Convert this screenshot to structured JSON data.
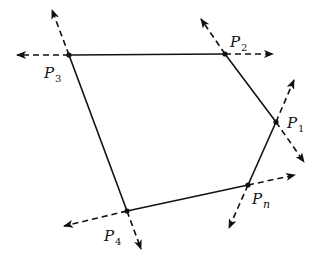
{
  "diagram": {
    "type": "polygon-with-edge-direction-arrows",
    "stroke_color": "#111111",
    "background": "#ffffff",
    "vertices": [
      {
        "id": "P1",
        "label": "P",
        "subscript": "1",
        "x": 276,
        "y": 122,
        "label_x": 287,
        "label_y": 128
      },
      {
        "id": "P2",
        "label": "P",
        "subscript": "2",
        "x": 225,
        "y": 54,
        "label_x": 230,
        "label_y": 47
      },
      {
        "id": "P3",
        "label": "P",
        "subscript": "3",
        "x": 69,
        "y": 55,
        "label_x": 44,
        "label_y": 78
      },
      {
        "id": "P4",
        "label": "P",
        "subscript": "4",
        "x": 127,
        "y": 211,
        "label_x": 104,
        "label_y": 241
      },
      {
        "id": "Pn",
        "label": "P",
        "subscript": "n",
        "x": 248,
        "y": 185,
        "label_x": 252,
        "label_y": 204
      }
    ],
    "edges": [
      [
        "P1",
        "P2"
      ],
      [
        "P2",
        "P3"
      ],
      [
        "P3",
        "P4"
      ],
      [
        "P4",
        "Pn"
      ],
      [
        "Pn",
        "P1"
      ]
    ],
    "arrows": [
      {
        "from": "P3",
        "x2": 52,
        "y2": 10
      },
      {
        "from": "P3",
        "x2": 17,
        "y2": 55
      },
      {
        "from": "P2",
        "x2": 201,
        "y2": 19
      },
      {
        "from": "P2",
        "x2": 273,
        "y2": 54
      },
      {
        "from": "P1",
        "x2": 294,
        "y2": 80
      },
      {
        "from": "P1",
        "x2": 304,
        "y2": 162
      },
      {
        "from": "Pn",
        "x2": 295,
        "y2": 175
      },
      {
        "from": "Pn",
        "x2": 229,
        "y2": 228
      },
      {
        "from": "P4",
        "x2": 64,
        "y2": 226
      },
      {
        "from": "P4",
        "x2": 141,
        "y2": 249
      }
    ]
  }
}
